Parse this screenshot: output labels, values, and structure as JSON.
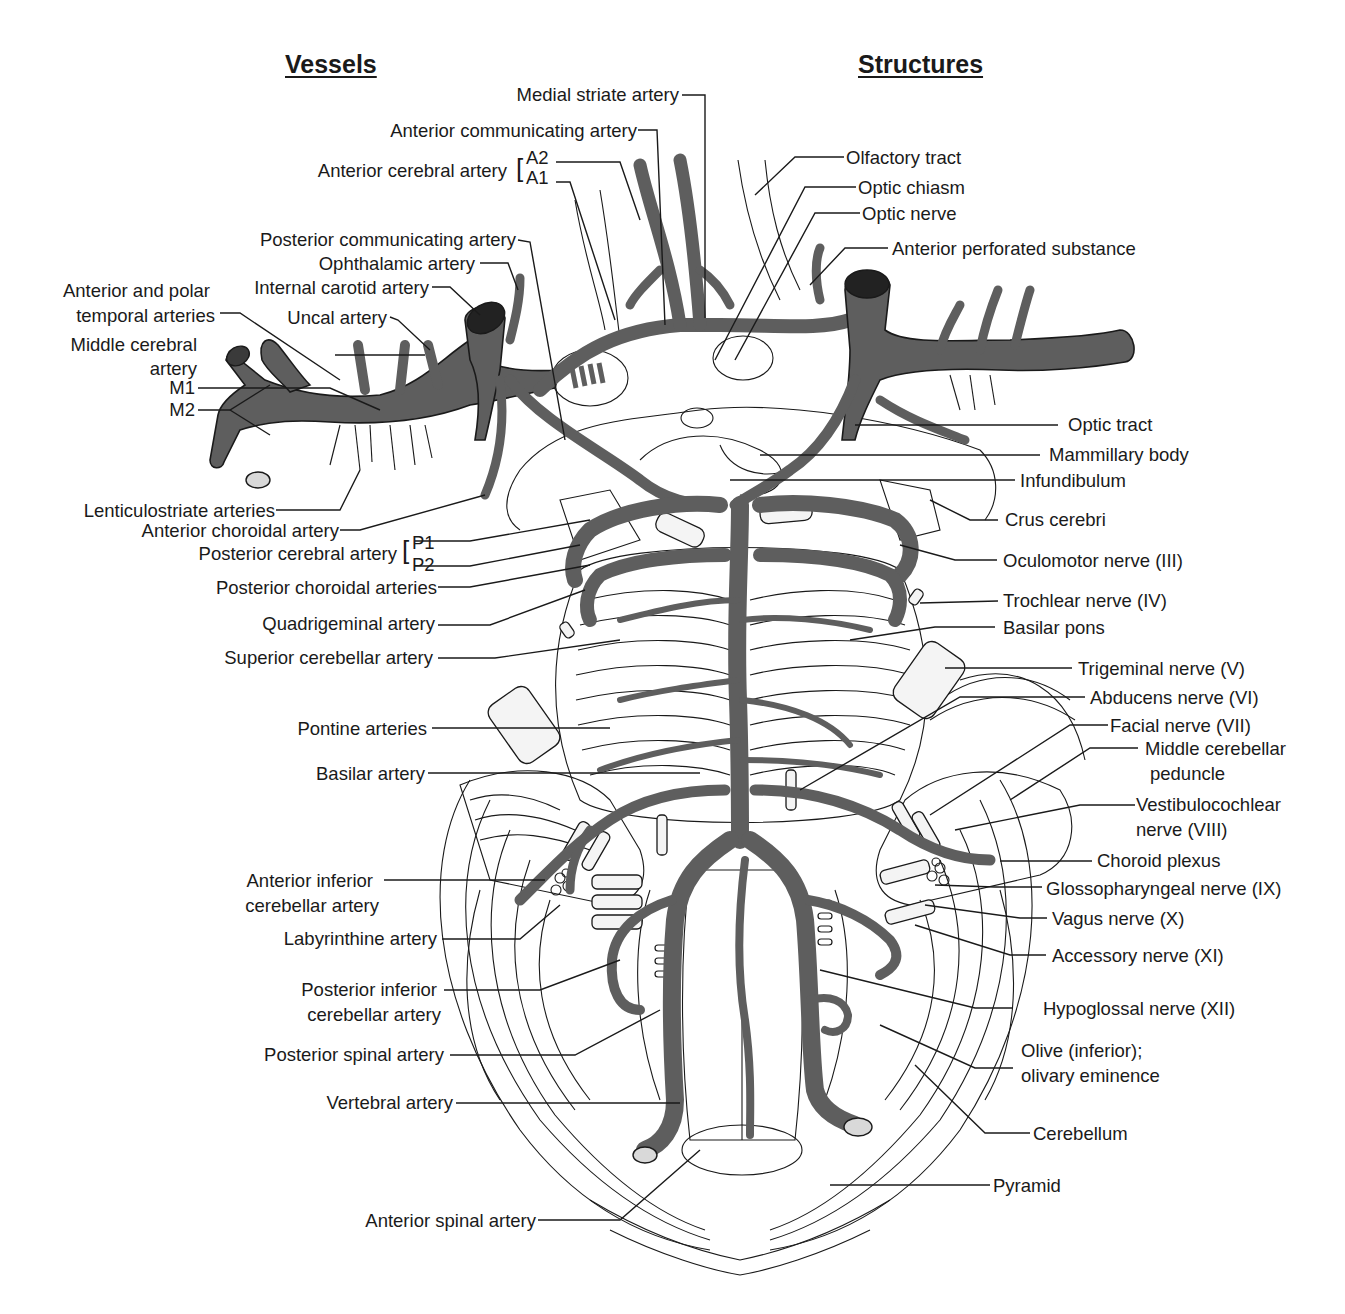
{
  "figure": {
    "headings": {
      "vessels": "Vessels",
      "structures": "Structures"
    },
    "colors": {
      "vessel_fill": "#5e5e5e",
      "line": "#1a1a1a",
      "background": "#ffffff"
    },
    "vessels_labels": [
      {
        "id": "medial-striate-artery",
        "text": "Medial striate artery"
      },
      {
        "id": "anterior-communicating-artery",
        "text": "Anterior communicating artery"
      },
      {
        "id": "anterior-cerebral-artery",
        "text": "Anterior cerebral artery",
        "segments": [
          "A2",
          "A1"
        ]
      },
      {
        "id": "posterior-communicating-artery",
        "text": "Posterior communicating artery"
      },
      {
        "id": "ophthalamic-artery",
        "text": "Ophthalamic artery"
      },
      {
        "id": "internal-carotid-artery",
        "text": "Internal carotid artery"
      },
      {
        "id": "anterior-polar-temporal-arteries",
        "text": "Anterior and polar temporal arteries",
        "lines": [
          "Anterior and polar",
          "temporal arteries"
        ]
      },
      {
        "id": "uncal-artery",
        "text": "Uncal artery"
      },
      {
        "id": "middle-cerebral-artery",
        "text": "Middle cerebral artery",
        "lines": [
          "Middle cerebral",
          "artery"
        ],
        "segments": [
          "M1",
          "M2"
        ]
      },
      {
        "id": "lenticulostriate-arteries",
        "text": "Lenticulostriate arteries"
      },
      {
        "id": "anterior-choroidal-artery",
        "text": "Anterior choroidal artery"
      },
      {
        "id": "posterior-cerebral-artery",
        "text": "Posterior cerebral artery",
        "segments": [
          "P1",
          "P2"
        ]
      },
      {
        "id": "posterior-choroidal-arteries",
        "text": "Posterior choroidal arteries"
      },
      {
        "id": "quadrigeminal-artery",
        "text": "Quadrigeminal artery"
      },
      {
        "id": "superior-cerebellar-artery",
        "text": "Superior cerebellar artery"
      },
      {
        "id": "pontine-arteries",
        "text": "Pontine arteries"
      },
      {
        "id": "basilar-artery",
        "text": "Basilar artery"
      },
      {
        "id": "anterior-inferior-cerebellar-artery",
        "text": "Anterior inferior cerebellar artery",
        "lines": [
          "Anterior inferior",
          "cerebellar artery"
        ]
      },
      {
        "id": "labyrinthine-artery",
        "text": "Labyrinthine artery"
      },
      {
        "id": "posterior-inferior-cerebellar-artery",
        "text": "Posterior inferior cerebellar artery",
        "lines": [
          "Posterior inferior",
          "cerebellar artery"
        ]
      },
      {
        "id": "posterior-spinal-artery",
        "text": "Posterior spinal artery"
      },
      {
        "id": "vertebral-artery",
        "text": "Vertebral artery"
      },
      {
        "id": "anterior-spinal-artery",
        "text": "Anterior spinal artery"
      }
    ],
    "structures_labels": [
      {
        "id": "olfactory-tract",
        "text": "Olfactory tract"
      },
      {
        "id": "optic-chiasm",
        "text": "Optic chiasm"
      },
      {
        "id": "optic-nerve",
        "text": "Optic nerve"
      },
      {
        "id": "anterior-perforated-substance",
        "text": "Anterior perforated substance"
      },
      {
        "id": "optic-tract",
        "text": "Optic tract"
      },
      {
        "id": "mammillary-body",
        "text": "Mammillary body"
      },
      {
        "id": "infundibulum",
        "text": "Infundibulum"
      },
      {
        "id": "crus-cerebri",
        "text": "Crus cerebri"
      },
      {
        "id": "oculomotor-nerve",
        "text": "Oculomotor nerve (III)"
      },
      {
        "id": "trochlear-nerve",
        "text": "Trochlear nerve (IV)"
      },
      {
        "id": "basilar-pons",
        "text": "Basilar pons"
      },
      {
        "id": "trigeminal-nerve",
        "text": "Trigeminal nerve (V)"
      },
      {
        "id": "abducens-nerve",
        "text": "Abducens nerve (VI)"
      },
      {
        "id": "facial-nerve",
        "text": "Facial nerve (VII)"
      },
      {
        "id": "middle-cerebellar-peduncle",
        "text": "Middle cerebellar peduncle",
        "lines": [
          "Middle cerebellar",
          "peduncle"
        ]
      },
      {
        "id": "vestibulocochlear-nerve",
        "text": "Vestibulocochlear nerve (VIII)",
        "lines": [
          "Vestibulocochlear",
          "nerve (VIII)"
        ]
      },
      {
        "id": "choroid-plexus",
        "text": "Choroid plexus"
      },
      {
        "id": "glossopharyngeal-nerve",
        "text": "Glossopharyngeal nerve (IX)"
      },
      {
        "id": "vagus-nerve",
        "text": "Vagus nerve (X)"
      },
      {
        "id": "accessory-nerve",
        "text": "Accessory nerve (XI)"
      },
      {
        "id": "hypoglossal-nerve",
        "text": "Hypoglossal nerve (XII)"
      },
      {
        "id": "olive",
        "text": "Olive (inferior); olivary eminence",
        "lines": [
          "Olive (inferior);",
          "olivary eminence"
        ]
      },
      {
        "id": "cerebellum",
        "text": "Cerebellum"
      },
      {
        "id": "pyramid",
        "text": "Pyramid"
      }
    ]
  }
}
